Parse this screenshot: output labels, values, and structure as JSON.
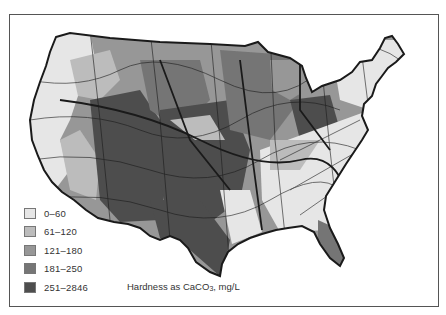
{
  "map": {
    "subject": "Water hardness in the contiguous United States",
    "caption": {
      "text": "Hardness as CaCO",
      "subscript": "3",
      "suffix": ", mg/L"
    },
    "legend": {
      "items": [
        {
          "label": "0–60",
          "color": "#e6e6e6"
        },
        {
          "label": "61–120",
          "color": "#bcbcbc"
        },
        {
          "label": "121–180",
          "color": "#979797"
        },
        {
          "label": "181–250",
          "color": "#767676"
        },
        {
          "label": "251–2846",
          "color": "#4e4e4e"
        }
      ]
    },
    "colors": {
      "border": "#1a1a1a",
      "frame": "#555555",
      "background": "#ffffff"
    }
  }
}
